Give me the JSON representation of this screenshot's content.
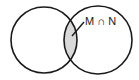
{
  "diagram": {
    "type": "venn",
    "sets": [
      {
        "name": "M",
        "cx": 44,
        "cy": 40,
        "r": 33
      },
      {
        "name": "N",
        "cx": 98,
        "cy": 40,
        "r": 34
      }
    ],
    "intersection_label": "M ∩ N",
    "colors": {
      "stroke": "#1a1a1a",
      "intersection_fill": "#d9d9d9",
      "background": "#ffffff"
    }
  }
}
